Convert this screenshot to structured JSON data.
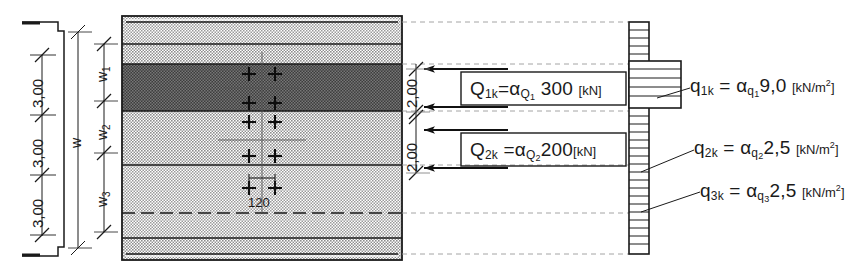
{
  "drawing": {
    "title": "Structural load diagram - wall section with horizontal loads",
    "background_color": "#ffffff",
    "ink_color": "#1a1a1a"
  },
  "left_dimension_chain": {
    "name": "storey-heights",
    "values": [
      "3,00",
      "3,00",
      "3,00"
    ]
  },
  "width_chain": {
    "overall_label": "w",
    "segments": [
      {
        "label": "w",
        "sub": "1"
      },
      {
        "label": "w",
        "sub": "2"
      },
      {
        "label": "w",
        "sub": "3"
      }
    ]
  },
  "section_block": {
    "center_dim": "120",
    "bands": [
      {
        "name": "band-top-light",
        "fill": "#d8d8d8"
      },
      {
        "name": "band-upper-light",
        "fill": "#d0d0d0"
      },
      {
        "name": "band-dark",
        "fill": "#6b6b6b"
      },
      {
        "name": "band-mid-light",
        "fill": "#cfcfcf"
      },
      {
        "name": "band-lower-light",
        "fill": "#cdcdcd"
      },
      {
        "name": "band-bottom",
        "fill": "#d2d2d2"
      }
    ]
  },
  "point_loads": {
    "arrow_spacing_labels": [
      "2,00",
      "2,00"
    ],
    "items": [
      {
        "name": "Q1k",
        "symbol": "Q",
        "sub": "1k",
        "equals": "=",
        "factor_base": "α",
        "factor_sub": "Q",
        "factor_sub2": "1",
        "value": "300",
        "unit": "[kN]",
        "boxed": true
      },
      {
        "name": "Q2k",
        "symbol": "Q",
        "sub": "2k",
        "equals": "=",
        "factor_base": "α",
        "factor_sub": "Q",
        "factor_sub2": "2",
        "value": "200",
        "unit": "[kN]",
        "boxed": true
      }
    ]
  },
  "distributed_loads": {
    "items": [
      {
        "name": "q1k",
        "symbol": "q",
        "sub": "1k",
        "equals": "=",
        "factor_base": "α",
        "factor_sub": "q",
        "factor_sub2": "1",
        "value": "9,0",
        "unit_open": "[kN/m",
        "unit_sup": "2",
        "unit_close": "]"
      },
      {
        "name": "q2k",
        "symbol": "q",
        "sub": "2k",
        "equals": "=",
        "factor_base": "α",
        "factor_sub": "q",
        "factor_sub2": "2",
        "value": "2,5",
        "unit_open": "[kN/m",
        "unit_sup": "2",
        "unit_close": "]"
      },
      {
        "name": "q3k",
        "symbol": "q",
        "sub": "3k",
        "equals": "=",
        "factor_base": "α",
        "factor_sub": "q",
        "factor_sub2": "3",
        "value": "2,5",
        "unit_open": "[kN/m",
        "unit_sup": "2",
        "unit_close": "]"
      }
    ]
  }
}
